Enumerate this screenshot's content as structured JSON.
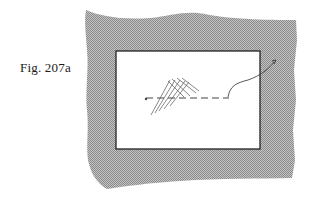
{
  "figure": {
    "caption": "Fig. 207a",
    "colors": {
      "fabric_shade": "#a8a8a8",
      "window_fill": "#ffffff",
      "outline": "#222222",
      "stitch_line": "#444444",
      "hatch_line": "#555555"
    }
  }
}
